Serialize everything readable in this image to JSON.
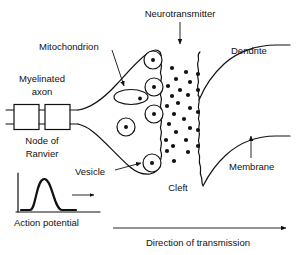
{
  "figure": {
    "background_color": "#ffffff",
    "ink_color": "#111111",
    "width": 296,
    "height": 255
  },
  "labels": {
    "neurotransmitter": "Neurotransmitter",
    "mitochondrion": "Mitochondrion",
    "myelinated_axon_line1": "Myelinated",
    "myelinated_axon_line2": "axon",
    "node_of_ranvier_line1": "Node of",
    "node_of_ranvier_line2": "Ranvier",
    "vesicle": "Vesicle",
    "cleft": "Cleft",
    "dendrite": "Dendrite",
    "membrane": "Membrane",
    "action_potential": "Action potential",
    "direction_of_transmission": "Direction of transmission"
  },
  "diagram_data": {
    "type": "anatomical-diagram",
    "subject": "chemical synapse",
    "structures": [
      {
        "name": "myelinated-axon",
        "description": "axon with two myelin sheath segments and a node of Ranvier gap between them"
      },
      {
        "name": "node-of-ranvier",
        "description": "unmyelinated gap between the two myelin segments"
      },
      {
        "name": "axon-terminal-bouton",
        "description": "triangular presynaptic terminal flaring from the axon"
      },
      {
        "name": "mitochondrion",
        "description": "ellipse with internal dot inside the terminal"
      },
      {
        "name": "synaptic-vesicles",
        "count": 6,
        "description": "circles with central dot; four docked along presynaptic membrane"
      },
      {
        "name": "presynaptic-membrane",
        "description": "wavy right border of the axon terminal"
      },
      {
        "name": "synaptic-cleft",
        "description": "gap between presynaptic and postsynaptic membranes filled with neurotransmitter dots"
      },
      {
        "name": "neurotransmitter-molecules",
        "count": 22,
        "description": "small filled dots dispersed across the cleft"
      },
      {
        "name": "postsynaptic-membrane",
        "description": "wavy left border of the dendrite"
      },
      {
        "name": "dendrite",
        "description": "postsynaptic process tapering to the right"
      }
    ],
    "annotations": [
      {
        "label": "Neurotransmitter",
        "points_to": "synaptic-cleft",
        "arrow": "down"
      },
      {
        "label": "Mitochondrion",
        "points_to": "mitochondrion",
        "arrow": "down-right"
      },
      {
        "label": "Vesicle",
        "points_to": "synaptic-vesicles",
        "arrow": "right"
      },
      {
        "label": "Membrane",
        "points_to": "dendrite-lower-boundary",
        "arrow": "up"
      },
      {
        "label": "Cleft",
        "points_to": "synaptic-cleft",
        "arrow": "none"
      },
      {
        "label": "Dendrite",
        "points_to": "dendrite",
        "arrow": "none"
      },
      {
        "label": "Myelinated axon",
        "points_to": "myelinated-axon",
        "arrow": "none"
      },
      {
        "label": "Node of Ranvier",
        "points_to": "node-of-ranvier",
        "arrow": "none"
      }
    ],
    "inset_plot": {
      "name": "action-potential",
      "type": "line",
      "caption": "Action potential",
      "axes": {
        "y_axis": true,
        "x_axis": true,
        "ticks": false,
        "tick_labels": false
      },
      "propagation_arrow": "right",
      "curve_shape": "single bell-shaped spike rising from baseline, peaking, and returning to baseline"
    },
    "flow_arrow": {
      "label": "Direction of transmission",
      "direction": "left-to-right",
      "from_x": 113,
      "to_x": 288,
      "y": 228
    }
  }
}
